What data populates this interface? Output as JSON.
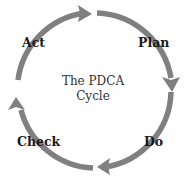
{
  "diagram": {
    "title_line1": "The PDCA",
    "title_line2": "Cycle",
    "stages": [
      {
        "label": "Plan"
      },
      {
        "label": "Do"
      },
      {
        "label": "Check"
      },
      {
        "label": "Act"
      }
    ],
    "arrow_color": "#7f7f7f",
    "direction": "clockwise"
  }
}
